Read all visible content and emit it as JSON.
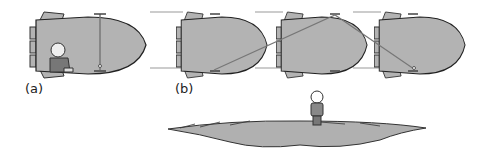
{
  "panels": [
    {
      "id": "a",
      "label": "(a)",
      "description": "rocket at rest with person seated and light beam going straight up"
    },
    {
      "id": "b",
      "label": "(b)",
      "description": "moving rocket at three instants, light beam traveling diagonally"
    }
  ],
  "observer": {
    "description": "person standing on ground watching"
  },
  "colors": {
    "hull": "#b3b3b3",
    "outline": "#333333",
    "ground": "#b0b0b0",
    "beam": "#777777"
  }
}
